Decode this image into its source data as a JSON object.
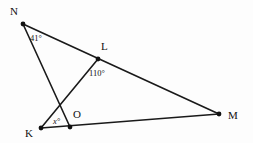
{
  "figure": {
    "background_color": "#fdfdfd",
    "line_color": "#1a1a1a",
    "label_color": "#111111"
  },
  "points": {
    "N": {
      "label": "N",
      "x": 23,
      "y": 24,
      "label_x": 10,
      "label_y": 15
    },
    "L": {
      "label": "L",
      "x": 98,
      "y": 59,
      "label_x": 101,
      "label_y": 50
    },
    "M": {
      "label": "M",
      "x": 219,
      "y": 114,
      "label_x": 228,
      "label_y": 119
    },
    "K": {
      "label": "K",
      "x": 41,
      "y": 128,
      "label_x": 25,
      "label_y": 137
    },
    "O": {
      "label": "O",
      "x": 70,
      "y": 127,
      "label_x": 73,
      "label_y": 118
    }
  },
  "segments": [
    {
      "name": "segment-n-m",
      "from": "N",
      "to": "M"
    },
    {
      "name": "segment-n-o",
      "from": "N",
      "to": "O"
    },
    {
      "name": "segment-k-l",
      "from": "K",
      "to": "L"
    },
    {
      "name": "segment-k-m",
      "from": "K",
      "to": "M"
    }
  ],
  "angles": [
    {
      "name": "angle-at-n",
      "value": "41°",
      "vertex": "N",
      "x": 30,
      "y": 41
    },
    {
      "name": "angle-at-l",
      "value": "110°",
      "vertex": "L",
      "x": 89,
      "y": 76
    },
    {
      "name": "angle-at-k",
      "value": "x°",
      "vertex": "K",
      "x": 53,
      "y": 124,
      "italic": true
    }
  ]
}
